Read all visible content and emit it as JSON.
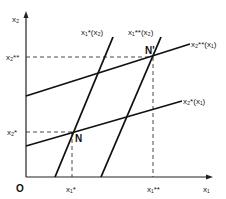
{
  "diagram": {
    "axes": {
      "origin_label": "O",
      "x_label": "x₁",
      "y_label": "x₂"
    },
    "curves": [
      {
        "id": "x2-star",
        "label": "x₂*(x₁)"
      },
      {
        "id": "x2-dstar",
        "label": "x₂**(x₁)"
      },
      {
        "id": "x1-star",
        "label": "x₁*(x₂)"
      },
      {
        "id": "x1-dstar",
        "label": "x₁**(x₂)"
      }
    ],
    "points": [
      {
        "id": "N",
        "label": "N"
      },
      {
        "id": "N-prime",
        "label": "N'"
      }
    ],
    "ticks": {
      "x1_star": "x₁*",
      "x1_dstar": "x₁**",
      "x2_star": "x₂*",
      "x2_dstar": "x₂**"
    }
  }
}
